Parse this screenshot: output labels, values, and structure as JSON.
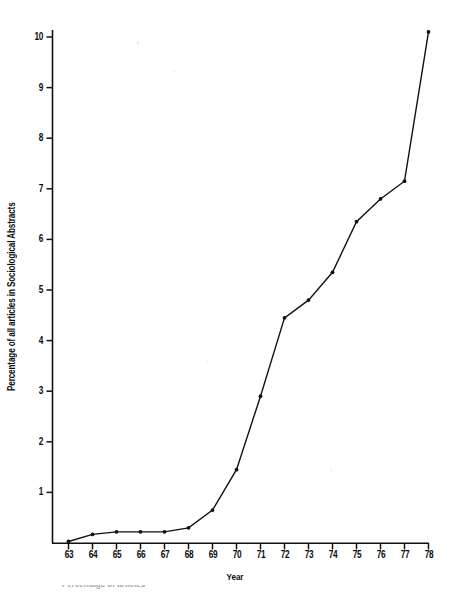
{
  "figure": {
    "background_color": "#ffffff",
    "ink_color": "#111111",
    "caption_fragment": "Percentage of articles"
  },
  "chart_data": {
    "type": "line",
    "title": "",
    "subtitle": "",
    "xlabel": "Year",
    "ylabel": "Percentage of all articles in Sociological Abstracts",
    "categories": [
      "63",
      "64",
      "65",
      "66",
      "67",
      "68",
      "69",
      "70",
      "71",
      "72",
      "73",
      "74",
      "75",
      "76",
      "77",
      "78"
    ],
    "x": [
      63,
      64,
      65,
      66,
      67,
      68,
      69,
      70,
      71,
      72,
      73,
      74,
      75,
      76,
      77,
      78
    ],
    "values": [
      0.03,
      0.17,
      0.22,
      0.22,
      0.22,
      0.3,
      0.65,
      1.45,
      2.9,
      4.45,
      4.8,
      5.35,
      6.35,
      6.8,
      7.15,
      10.1
    ],
    "series": [
      {
        "name": "Percentage of all articles in Sociological Abstracts",
        "values": [
          0.03,
          0.17,
          0.22,
          0.22,
          0.22,
          0.3,
          0.65,
          1.45,
          2.9,
          4.45,
          4.8,
          5.35,
          6.35,
          6.8,
          7.15,
          10.1
        ]
      }
    ],
    "xtick_labels": [
      "63",
      "64",
      "65",
      "66",
      "67",
      "68",
      "69",
      "70",
      "71",
      "72",
      "73",
      "74",
      "75",
      "76",
      "77",
      "78"
    ],
    "ytick_labels": [
      "1",
      "2",
      "3",
      "4",
      "5",
      "6",
      "7",
      "8",
      "9",
      "10"
    ],
    "yticks": [
      1,
      2,
      3,
      4,
      5,
      6,
      7,
      8,
      9,
      10
    ],
    "xlim": [
      62.5,
      78.5
    ],
    "ylim": [
      0,
      10.45
    ],
    "grid": false,
    "legend": false,
    "legend_position": "none",
    "marker": "dot",
    "line_color": "#111111",
    "line_width": 1.4
  }
}
